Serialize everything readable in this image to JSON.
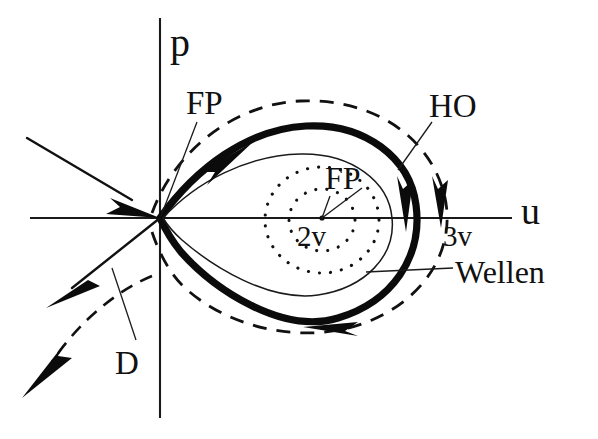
{
  "figure": {
    "type": "phase-portrait-diagram",
    "title": "",
    "background_color": "#ffffff",
    "ink_color": "#111111",
    "axes": {
      "horizontal_label": "u",
      "vertical_label": "p",
      "origin_label": "FP"
    },
    "labels": [
      {
        "id": "p-axis",
        "text": "p",
        "role": "axis-label"
      },
      {
        "id": "u-axis",
        "text": "u",
        "role": "axis-label"
      },
      {
        "id": "fp-saddle",
        "text": "FP",
        "role": "fixed-point-label"
      },
      {
        "id": "fp-center",
        "text": "FP",
        "role": "fixed-point-label"
      },
      {
        "id": "ho",
        "text": "HO",
        "role": "curve-label"
      },
      {
        "id": "wellen",
        "text": "Wellen",
        "role": "curve-label"
      },
      {
        "id": "two-v",
        "text": "2v",
        "role": "region-label"
      },
      {
        "id": "three-v",
        "text": "3v",
        "role": "region-label"
      },
      {
        "id": "d-manifold",
        "text": "D",
        "role": "curve-label"
      }
    ],
    "curves": [
      {
        "id": "homoclinic-orbit",
        "style": "thick-solid",
        "label": "HO"
      },
      {
        "id": "outer-periodic-orbit",
        "style": "dashed",
        "label": "D"
      },
      {
        "id": "inner-periodic-orbit",
        "style": "thin-solid",
        "label": "Wellen"
      },
      {
        "id": "dotted-orbit-outer",
        "style": "dotted",
        "label": "2v"
      },
      {
        "id": "dotted-orbit-inner",
        "style": "dotted",
        "label": "2v"
      },
      {
        "id": "stable-manifold",
        "style": "solid-arrow",
        "label": "FP"
      },
      {
        "id": "unstable-manifold",
        "style": "dashed-arrow",
        "label": "D"
      }
    ]
  }
}
